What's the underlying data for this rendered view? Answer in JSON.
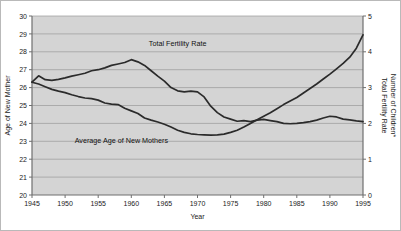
{
  "chart_data": {
    "type": "line",
    "title": "",
    "xlabel": "Year",
    "grid": true,
    "grid_orientation": "horizontal",
    "legend_position": "inline-annotation",
    "plot_background": "#d4d4d4",
    "line_color": "#2b2b2b",
    "axis_color": "#7a7a7a",
    "grid_color": "#9a9a9a",
    "xlim": [
      1945,
      1995
    ],
    "x_ticks": [
      1945,
      1950,
      1955,
      1960,
      1965,
      1970,
      1975,
      1980,
      1985,
      1990,
      1995
    ],
    "x_tick_labels": [
      "1945",
      "1950",
      "1955",
      "1960",
      "1965",
      "1970",
      "1975",
      "1980",
      "1985",
      "1990",
      "1995"
    ],
    "left_axis": {
      "label": "Age of New Mother",
      "ylim": [
        20,
        30
      ],
      "ticks": [
        20,
        21,
        22,
        23,
        24,
        25,
        26,
        27,
        28,
        29,
        30
      ],
      "tick_labels": [
        "20",
        "21",
        "22",
        "23",
        "24",
        "25",
        "26",
        "27",
        "28",
        "29",
        "30"
      ]
    },
    "right_axis": {
      "label_line1": "Total Fertility Rate",
      "label_line2": "Number of Children*",
      "ylim": [
        0,
        5
      ],
      "ticks": [
        0,
        1,
        2,
        3,
        4,
        5
      ],
      "tick_labels": [
        "0",
        "1",
        "2",
        "3",
        "4",
        "5"
      ]
    },
    "series": [
      {
        "name": "Total Fertility Rate",
        "annotation": "Total Fertility Rate",
        "axis": "right",
        "units": "children per woman",
        "x": [
          1945,
          1946,
          1947,
          1948,
          1949,
          1950,
          1951,
          1952,
          1953,
          1954,
          1955,
          1956,
          1957,
          1958,
          1959,
          1960,
          1961,
          1962,
          1963,
          1964,
          1965,
          1966,
          1967,
          1968,
          1969,
          1970,
          1971,
          1972,
          1973,
          1974,
          1975,
          1976,
          1977,
          1978,
          1979,
          1980,
          1981,
          1982,
          1983,
          1984,
          1985,
          1986,
          1987,
          1988,
          1989,
          1990,
          1991,
          1992,
          1993,
          1994,
          1995
        ],
        "values": [
          3.15,
          3.33,
          3.22,
          3.2,
          3.23,
          3.27,
          3.32,
          3.36,
          3.4,
          3.47,
          3.5,
          3.55,
          3.62,
          3.66,
          3.7,
          3.78,
          3.72,
          3.62,
          3.47,
          3.32,
          3.18,
          3.0,
          2.91,
          2.88,
          2.9,
          2.88,
          2.74,
          2.48,
          2.3,
          2.18,
          2.12,
          2.06,
          2.08,
          2.05,
          2.09,
          2.11,
          2.08,
          2.05,
          2.0,
          1.99,
          2.0,
          2.02,
          2.05,
          2.09,
          2.15,
          2.2,
          2.18,
          2.12,
          2.1,
          2.07,
          2.05
        ]
      },
      {
        "name": "Average Age of New Mothers",
        "annotation": "Average Age of New Mothers",
        "axis": "left",
        "units": "years",
        "x": [
          1945,
          1946,
          1947,
          1948,
          1949,
          1950,
          1951,
          1952,
          1953,
          1954,
          1955,
          1956,
          1957,
          1958,
          1959,
          1960,
          1961,
          1962,
          1963,
          1964,
          1965,
          1966,
          1967,
          1968,
          1969,
          1970,
          1971,
          1972,
          1973,
          1974,
          1975,
          1976,
          1977,
          1978,
          1979,
          1980,
          1981,
          1982,
          1983,
          1984,
          1985,
          1986,
          1987,
          1988,
          1989,
          1990,
          1991,
          1992,
          1993,
          1994,
          1995
        ],
        "values": [
          26.3,
          26.2,
          26.05,
          25.9,
          25.8,
          25.72,
          25.6,
          25.5,
          25.42,
          25.38,
          25.3,
          25.14,
          25.08,
          25.05,
          24.85,
          24.7,
          24.55,
          24.3,
          24.18,
          24.08,
          23.95,
          23.8,
          23.62,
          23.5,
          23.42,
          23.38,
          23.36,
          23.34,
          23.36,
          23.4,
          23.5,
          23.62,
          23.8,
          24.0,
          24.2,
          24.4,
          24.6,
          24.82,
          25.05,
          25.25,
          25.45,
          25.7,
          25.95,
          26.2,
          26.48,
          26.75,
          27.05,
          27.35,
          27.7,
          28.2,
          28.95
        ]
      }
    ]
  }
}
